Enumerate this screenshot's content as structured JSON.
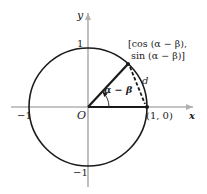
{
  "diagram": {
    "type": "unit-circle",
    "axes": {
      "x_label": "x",
      "y_label": "y",
      "origin_label": "O"
    },
    "ticks": {
      "x_neg": "−1",
      "y_pos": "1",
      "y_neg": "−1"
    },
    "points": {
      "on_x_axis": "(1, 0)",
      "on_circle_line1": "[cos (α − β),",
      "on_circle_line2": "sin (α − β)]"
    },
    "angle_label": "α − β",
    "chord_label": "d",
    "colors": {
      "axis": "#b0b0b0",
      "circle": "#1a1a1a",
      "text": "#222222"
    }
  }
}
